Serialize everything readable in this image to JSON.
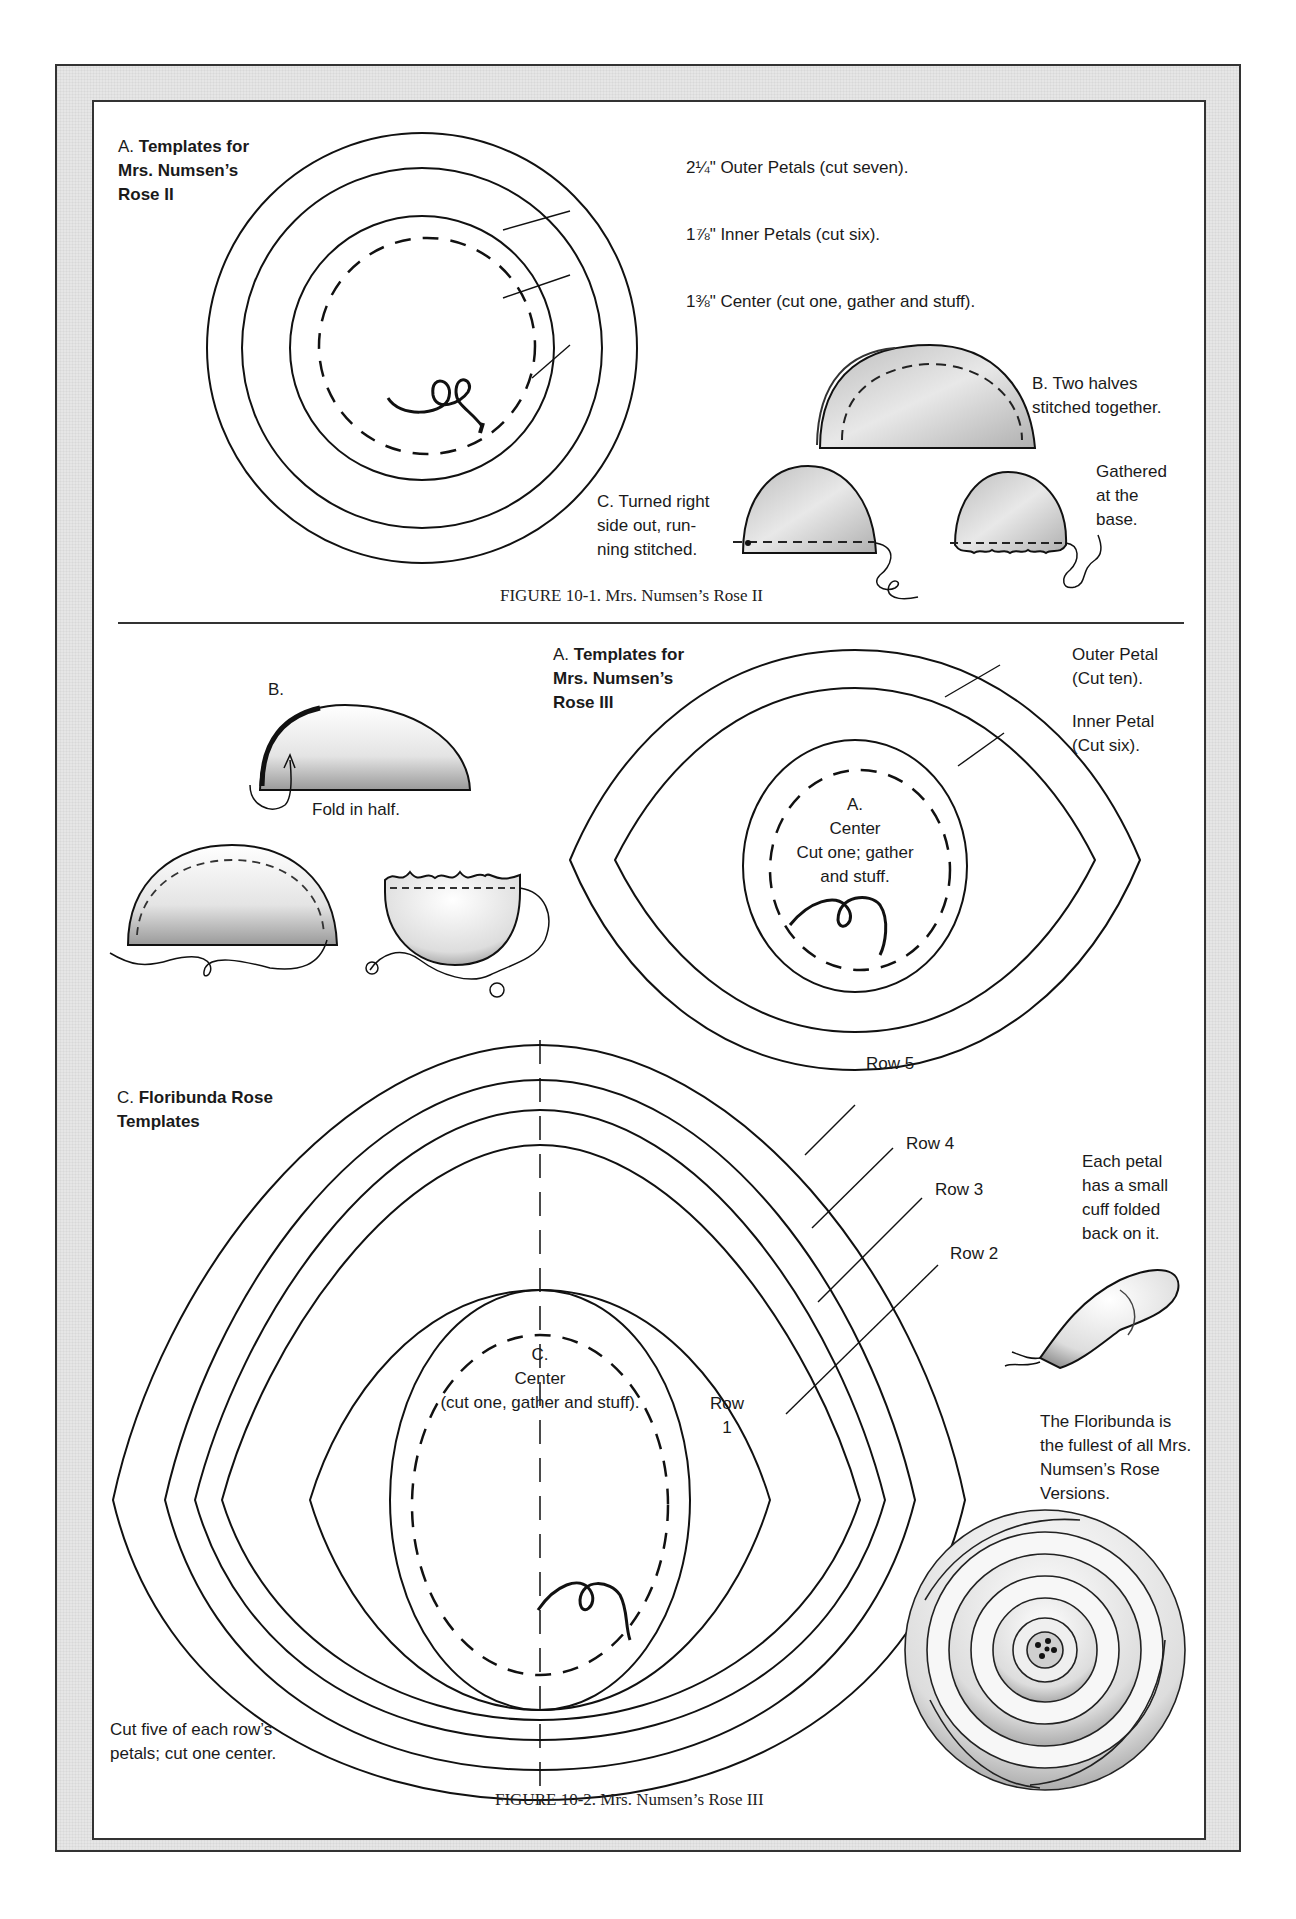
{
  "figure_1": {
    "caption": "FIGURE 10-1. Mrs. Numsen’s Rose II",
    "section_a": {
      "prefix": "A.",
      "title_line1": "Templates for",
      "title_line2": "Mrs. Numsen’s",
      "title_line3": "Rose II"
    },
    "callouts": [
      {
        "text": "2¼\" Outer Petals (cut seven)."
      },
      {
        "text": "1⅞\" Inner Petals (cut six)."
      },
      {
        "text": "1⅜\" Center (cut one, gather and stuff)."
      }
    ],
    "section_b": {
      "line1": "B. Two halves",
      "line2": "stitched together."
    },
    "section_c": {
      "line1": "C. Turned right",
      "line2": "side out, run-",
      "line3": "ning stitched."
    },
    "gathered": {
      "line1": "Gathered",
      "line2": "at the",
      "line3": "base."
    }
  },
  "figure_2": {
    "caption": "FIGURE 10-2. Mrs. Numsen’s Rose III",
    "section_b": {
      "label": "B.",
      "fold_note": "Fold in half."
    },
    "section_a": {
      "prefix": "A.",
      "title_line1": "Templates for",
      "title_line2": "Mrs. Numsen’s",
      "title_line3": "Rose III"
    },
    "outer_petal": {
      "line1": "Outer Petal",
      "line2": "(Cut ten)."
    },
    "inner_petal": {
      "line1": "Inner Petal",
      "line2": "(Cut six)."
    },
    "center_a": {
      "line1": "A.",
      "line2": "Center",
      "line3": "Cut one; gather",
      "line4": "and stuff."
    },
    "section_c": {
      "prefix": "C.",
      "title_line1": "Floribunda Rose",
      "title_line2": "Templates"
    },
    "rows": {
      "row5": "Row 5",
      "row4": "Row 4",
      "row3": "Row 3",
      "row2": "Row 2",
      "row1_line1": "Row",
      "row1_line2": "1"
    },
    "center_c": {
      "line1": "C.",
      "line2": "Center",
      "line3": "(cut one, gather and stuff)."
    },
    "petal_note": {
      "line1": "Each petal",
      "line2": "has a small",
      "line3": "cuff folded",
      "line4": "back on it."
    },
    "floribunda_note": {
      "line1": "The Floribunda is",
      "line2": "the fullest of all Mrs.",
      "line3": "Numsen’s Rose",
      "line4": "Versions."
    },
    "cut_note": {
      "line1": "Cut five of each row’s",
      "line2": "petals; cut one center."
    }
  }
}
